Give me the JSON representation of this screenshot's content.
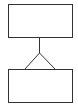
{
  "diagram": {
    "type": "er-relationship",
    "stroke_color": "#333333",
    "background": "#ffffff",
    "nodes": [
      {
        "id": "entity-top",
        "label": "",
        "x": 8,
        "y": 4,
        "w": 64,
        "h": 33
      },
      {
        "id": "entity-bottom",
        "label": "",
        "x": 8,
        "y": 69,
        "w": 64,
        "h": 33
      }
    ],
    "edges": [
      {
        "from": "entity-top",
        "to": "entity-bottom",
        "from_cardinality": "one",
        "to_cardinality": "many",
        "notation": "crows-foot"
      }
    ]
  }
}
